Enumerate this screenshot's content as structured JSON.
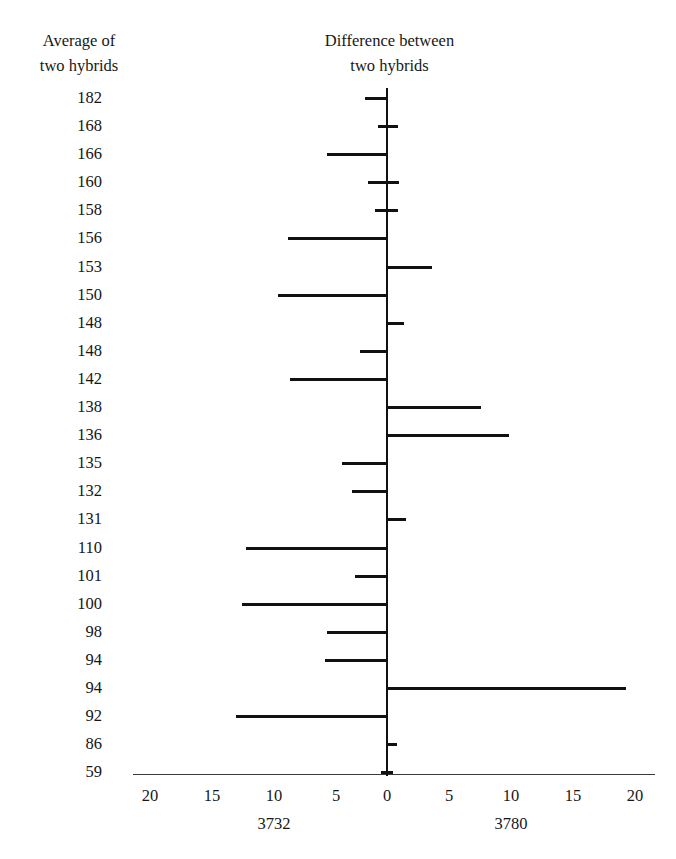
{
  "headers": {
    "left": "Average of\ntwo hybrids",
    "right": "Difference between\ntwo hybrids"
  },
  "axis": {
    "tick_labels": [
      "20",
      "15",
      "10",
      "5",
      "0",
      "5",
      "10",
      "15",
      "20"
    ],
    "tick_positions_px": [
      150,
      212,
      274,
      336,
      387,
      449,
      511,
      573,
      635
    ],
    "notes": [
      {
        "text": "3732",
        "x_px": 274
      },
      {
        "text": "3780",
        "x_px": 511
      }
    ]
  },
  "chart_data": {
    "type": "bar",
    "orientation": "horizontal",
    "title": "",
    "subtitle": "",
    "xlabel": "Difference between two hybrids",
    "ylabel": "Average of two hybrids",
    "xlim": [
      -20,
      20
    ],
    "grid": false,
    "legend": null,
    "note_left": "3732",
    "note_right": "3780",
    "categories": [
      "182",
      "168",
      "166",
      "160",
      "158",
      "156",
      "153",
      "150",
      "148",
      "148",
      "142",
      "138",
      "136",
      "135",
      "132",
      "131",
      "110",
      "101",
      "100",
      "98",
      "94",
      "94",
      "92",
      "86",
      "59"
    ],
    "series": [
      {
        "name": "difference",
        "values": [
          -1.8,
          0.9,
          -4.8,
          1.0,
          0.9,
          -8.0,
          3.6,
          -8.8,
          1.4,
          -2.2,
          -7.8,
          7.6,
          9.8,
          -3.6,
          -2.8,
          1.5,
          -11.4,
          -2.6,
          -11.7,
          -4.8,
          -5.0,
          19.3,
          -12.2,
          0.8,
          0.5
        ]
      }
    ],
    "segments": [
      {
        "category": "182",
        "start": -1.8,
        "end": 0.0
      },
      {
        "category": "168",
        "start": -0.7,
        "end": 0.9
      },
      {
        "category": "166",
        "start": -4.8,
        "end": 0.0
      },
      {
        "category": "160",
        "start": -1.5,
        "end": 1.0
      },
      {
        "category": "158",
        "start": -1.0,
        "end": 0.9
      },
      {
        "category": "156",
        "start": -8.0,
        "end": 0.0
      },
      {
        "category": "153",
        "start": 0.0,
        "end": 3.6
      },
      {
        "category": "150",
        "start": -8.8,
        "end": 0.0
      },
      {
        "category": "148",
        "start": 0.0,
        "end": 1.4
      },
      {
        "category": "148",
        "start": -2.2,
        "end": 0.0
      },
      {
        "category": "142",
        "start": -7.8,
        "end": 0.0
      },
      {
        "category": "138",
        "start": 0.0,
        "end": 7.6
      },
      {
        "category": "136",
        "start": 0.0,
        "end": 9.8
      },
      {
        "category": "135",
        "start": -3.6,
        "end": 0.0
      },
      {
        "category": "132",
        "start": -2.8,
        "end": 0.0
      },
      {
        "category": "131",
        "start": 0.0,
        "end": 1.5
      },
      {
        "category": "110",
        "start": -11.4,
        "end": 0.0
      },
      {
        "category": "101",
        "start": -2.6,
        "end": 0.0
      },
      {
        "category": "100",
        "start": -11.7,
        "end": 0.0
      },
      {
        "category": "98",
        "start": -4.8,
        "end": 0.0
      },
      {
        "category": "94",
        "start": -5.0,
        "end": 0.0
      },
      {
        "category": "94",
        "start": 0.0,
        "end": 19.3
      },
      {
        "category": "92",
        "start": -12.2,
        "end": 0.0
      },
      {
        "category": "86",
        "start": 0.0,
        "end": 0.8
      },
      {
        "category": "59",
        "start": -0.5,
        "end": 0.5
      }
    ]
  }
}
